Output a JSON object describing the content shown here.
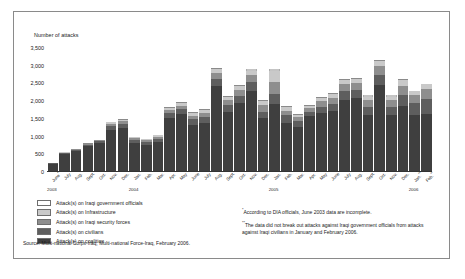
{
  "chart_data": {
    "type": "bar",
    "stacked": true,
    "title": "",
    "xlabel": "",
    "ylabel": "Number of attacks",
    "ylim": [
      0,
      3500
    ],
    "ytick_labels": [
      "3,500",
      "3,000",
      "2,500",
      "2,000",
      "1,500",
      "1,000",
      "500",
      "0"
    ],
    "ytick_values": [
      3500,
      3000,
      2500,
      2000,
      1500,
      1000,
      500,
      0
    ],
    "grid": false,
    "legend_position": "below-left",
    "categories": [
      "June*",
      "July",
      "Aug.",
      "Sept.",
      "Oct.",
      "Nov.",
      "Dec.",
      "Jan.",
      "Feb.",
      "Mar.",
      "Apr.",
      "May",
      "June",
      "July",
      "Aug.",
      "Sept.",
      "Oct.",
      "Nov.",
      "Dec.",
      "Jan.",
      "Feb.",
      "Mar.",
      "Apr.",
      "May",
      "June",
      "July",
      "Aug.",
      "Sept.",
      "Oct.",
      "Nov.",
      "Dec.",
      "Jan.**",
      "Feb.**"
    ],
    "year_markers": [
      {
        "label": "2003",
        "index": 0
      },
      {
        "label": "2004",
        "index": 7
      },
      {
        "label": "2005",
        "index": 19
      },
      {
        "label": "2006",
        "index": 31
      }
    ],
    "series": [
      {
        "name": "Attack(s) on coalition",
        "color": "#3f3f3f",
        "values": [
          200,
          480,
          570,
          700,
          790,
          1180,
          1230,
          790,
          750,
          830,
          1520,
          1620,
          1320,
          1370,
          2430,
          1680,
          1930,
          2290,
          1500,
          1900,
          1380,
          1250,
          1560,
          1650,
          1710,
          2030,
          2080,
          1600,
          2440,
          1580,
          1850,
          1600,
          1620
        ]
      },
      {
        "name": "Attack(s) on civilians",
        "color": "#5e5e5e",
        "values": [
          18,
          30,
          35,
          45,
          55,
          110,
          120,
          80,
          75,
          90,
          120,
          140,
          150,
          160,
          190,
          190,
          210,
          250,
          190,
          290,
          210,
          170,
          120,
          180,
          200,
          260,
          230,
          230,
          300,
          230,
          300,
          340,
          420
        ]
      },
      {
        "name": "Attack(s) on Iraqi security forces",
        "color": "#8e8e8e",
        "values": [
          10,
          15,
          20,
          25,
          30,
          60,
          70,
          60,
          55,
          60,
          90,
          100,
          110,
          120,
          180,
          140,
          160,
          190,
          180,
          350,
          130,
          110,
          110,
          150,
          170,
          180,
          200,
          190,
          250,
          200,
          280,
          220,
          290
        ]
      },
      {
        "name": "Attack(s) on Infrastructure",
        "color": "#c9c9c9",
        "values": [
          5,
          8,
          10,
          12,
          15,
          40,
          45,
          40,
          35,
          40,
          70,
          80,
          85,
          90,
          110,
          100,
          110,
          130,
          110,
          320,
          90,
          70,
          60,
          100,
          110,
          110,
          120,
          100,
          140,
          110,
          150,
          130,
          160
        ]
      },
      {
        "name": "Attack(s) on Iraqi government officials",
        "color": "#ffffff",
        "values": [
          2,
          3,
          4,
          5,
          6,
          10,
          12,
          10,
          10,
          10,
          20,
          20,
          25,
          25,
          30,
          30,
          30,
          30,
          30,
          30,
          30,
          20,
          20,
          30,
          30,
          30,
          30,
          30,
          30,
          30,
          40,
          0,
          0
        ]
      }
    ]
  },
  "legend": {
    "items": [
      {
        "label": "Attack(s) on Iraqi government officials",
        "color": "#ffffff"
      },
      {
        "label": "Attack(s) on Infrastructure",
        "color": "#c9c9c9"
      },
      {
        "label": "Attack(s) on Iraqi security forces",
        "color": "#8e8e8e"
      },
      {
        "label": "Attack(s) on civilians",
        "color": "#5e5e5e"
      },
      {
        "label": "Attack(s) on coalition",
        "color": "#3f3f3f"
      }
    ]
  },
  "notes": [
    "*According to DIA officials, June 2003 data are incomplete.",
    "**The data did not break out attacks against Iraqi government officials from attacks against Iraqi civilians in January and February 2006."
  ],
  "source": "Source: Multi-national Corps-Iraq, Multi-national Force-Iraq, February 2006."
}
